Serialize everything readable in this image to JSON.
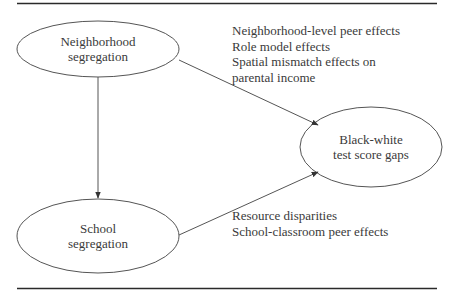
{
  "diagram": {
    "nodes": [
      {
        "id": "neighborhood",
        "lines": [
          "Neighborhood",
          "segregation"
        ]
      },
      {
        "id": "school",
        "lines": [
          "School",
          "segregation"
        ]
      },
      {
        "id": "gaps",
        "lines": [
          "Black-white",
          "test score gaps"
        ]
      }
    ],
    "edges": [
      {
        "from": "neighborhood",
        "to": "school"
      },
      {
        "from": "neighborhood",
        "to": "gaps"
      },
      {
        "from": "school",
        "to": "gaps"
      }
    ],
    "annotations": {
      "neighborhood_to_gaps": [
        "Neighborhood-level peer effects",
        "Role model effects",
        "Spatial mismatch effects on",
        "parental income"
      ],
      "school_to_gaps": [
        "Resource disparities",
        "School-classroom peer effects"
      ]
    },
    "colors": {
      "rule": "#2a2a2a",
      "stroke": "#555555",
      "text": "#3a3a3a"
    }
  }
}
